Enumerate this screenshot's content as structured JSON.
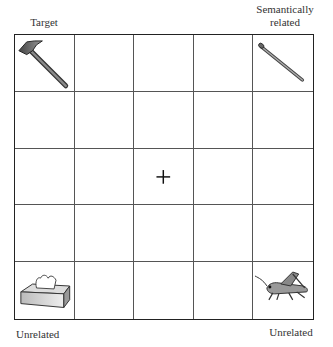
{
  "labels": {
    "top_left": "Target",
    "top_right_line1": "Semantically",
    "top_right_line2": "related",
    "bottom_left": "Unrelated",
    "bottom_right": "Unrelated"
  },
  "grid": {
    "rows": 5,
    "cols": 5,
    "items": [
      {
        "row": 0,
        "col": 0,
        "icon": "hammer-icon",
        "role": "Target"
      },
      {
        "row": 0,
        "col": 4,
        "icon": "nail-icon",
        "role": "Semantically related"
      },
      {
        "row": 4,
        "col": 0,
        "icon": "tissue-box-icon",
        "role": "Unrelated"
      },
      {
        "row": 4,
        "col": 4,
        "icon": "grasshopper-icon",
        "role": "Unrelated"
      },
      {
        "row": 2,
        "col": 2,
        "icon": "fixation-cross-icon",
        "role": "Fixation"
      }
    ]
  }
}
